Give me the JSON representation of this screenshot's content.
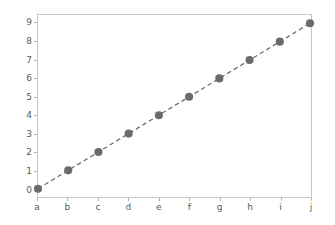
{
  "chart_data": {
    "type": "line",
    "title": "",
    "xlabel": "",
    "ylabel": "",
    "categories": [
      "a",
      "b",
      "c",
      "d",
      "e",
      "f",
      "g",
      "h",
      "i",
      "j"
    ],
    "values": [
      0,
      1,
      2,
      3,
      4,
      5,
      6,
      7,
      8,
      9
    ],
    "series": [
      {
        "name": "",
        "values": [
          0,
          1,
          2,
          3,
          4,
          5,
          6,
          7,
          8,
          9
        ],
        "line_style": "dashed",
        "marker": "circle",
        "color": "#6b6b6b"
      }
    ],
    "ylim": [
      -0.45,
      9.45
    ],
    "yticks": [
      0,
      1,
      2,
      3,
      4,
      5,
      6,
      7,
      8,
      9
    ],
    "ytick_labels": [
      "0",
      "1",
      "2",
      "3",
      "4",
      "5",
      "6",
      "7",
      "8",
      "9"
    ],
    "xtick_labels": [
      "a",
      "b",
      "c",
      "d",
      "e",
      "f",
      "g",
      "h",
      "i",
      "j"
    ],
    "grid": false,
    "legend": false,
    "legend_position": "none"
  },
  "style": {
    "figure_background": "#ffffff",
    "axes_background": "#ffffff",
    "spine_color": "#c6c6c6",
    "tick_color": "#b4b4b4",
    "tick_label_color": "#5a5a5a",
    "line_color": "#6b6b6b",
    "marker_color": "#6b6b6b"
  }
}
